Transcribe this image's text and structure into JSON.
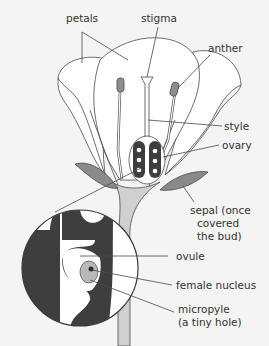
{
  "colors": {
    "background": "#f4f4f4",
    "outline": "#4a4a4a",
    "petal_fill": "#ffffff",
    "sepal_fill": "#8a8a8a",
    "receptacle_fill": "#d0d0d0",
    "ovary_dark": "#3e3e3e",
    "anther_fill": "#8e8e8e",
    "nucleus_fill": "#b8b8b8",
    "label_text": "#333333"
  },
  "labels": {
    "petals": "petals",
    "stigma": "stigma",
    "anther": "anther",
    "style": "style",
    "ovary": "ovary",
    "sepal": [
      "sepal (once",
      "covered",
      "the bud)"
    ],
    "ovule": "ovule",
    "female_nucleus": "female nucleus",
    "micropyle": [
      "micropyle",
      "(a tiny hole)"
    ]
  }
}
